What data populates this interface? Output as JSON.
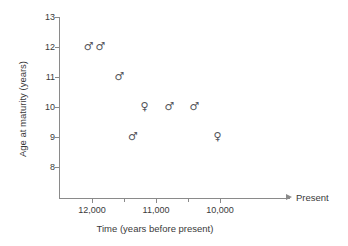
{
  "chart_data": {
    "type": "scatter",
    "title": "",
    "xlabel": "Time (years before present)",
    "ylabel": "Age at maturity (years)",
    "xlim": [
      12350,
      9700
    ],
    "ylim": [
      8,
      13
    ],
    "x_axis_direction": "decreasing",
    "x_end_annotation": "Present",
    "grid": false,
    "legend": "none",
    "y_ticks": [
      13,
      12,
      11,
      10,
      9,
      8
    ],
    "y_tick_labels": [
      "13",
      "12",
      "11",
      "10",
      "9",
      "8"
    ],
    "x_ticks": [
      12000,
      11500,
      11000,
      10500,
      10000
    ],
    "x_tick_labels": [
      "12,000",
      "",
      "11,000",
      "",
      "10,000"
    ],
    "x_minor_ticks": [
      11500,
      10500
    ],
    "series": [
      {
        "name": "male",
        "marker": "♂",
        "points": [
          {
            "x": 12050,
            "y": 12.0
          },
          {
            "x": 11870,
            "y": 12.0
          },
          {
            "x": 11570,
            "y": 11.0
          },
          {
            "x": 11360,
            "y": 9.0
          },
          {
            "x": 10790,
            "y": 10.0
          },
          {
            "x": 10400,
            "y": 10.0
          }
        ]
      },
      {
        "name": "female",
        "marker": "♀",
        "points": [
          {
            "x": 11180,
            "y": 10.0
          },
          {
            "x": 10040,
            "y": 9.0
          }
        ]
      }
    ]
  },
  "axes": {
    "y_title": "Age at maturity (years)",
    "x_title": "Time (years before present)",
    "present_label": "Present"
  },
  "ticks": {
    "y": [
      {
        "label": "13",
        "value": 13
      },
      {
        "label": "12",
        "value": 12
      },
      {
        "label": "11",
        "value": 11
      },
      {
        "label": "10",
        "value": 10
      },
      {
        "label": "9",
        "value": 9
      },
      {
        "label": "8",
        "value": 8
      }
    ],
    "x": [
      {
        "label": "12,000",
        "value": 12000,
        "minor": false
      },
      {
        "label": "",
        "value": 11500,
        "minor": true
      },
      {
        "label": "11,000",
        "value": 11000,
        "minor": false
      },
      {
        "label": "",
        "value": 10500,
        "minor": true
      },
      {
        "label": "10,000",
        "value": 10000,
        "minor": false
      }
    ]
  },
  "colors": {
    "axis": "#8a8a8a",
    "text": "#3a3a3a",
    "marker": "#55555c",
    "background": "#ffffff"
  }
}
